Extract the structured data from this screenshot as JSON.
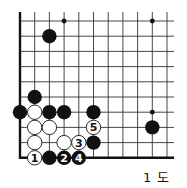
{
  "diagram": {
    "caption": "1 도",
    "grid": {
      "origin_x": 20,
      "origin_y": 21,
      "spacing_x": 14.7,
      "spacing_y": 15.2,
      "cols": 11,
      "rows": 10,
      "extend_right": 174,
      "extend_top": 12,
      "edges": [
        "left",
        "bottom"
      ]
    },
    "hoshi": [
      {
        "col": 3,
        "row": 0
      },
      {
        "col": 9,
        "row": 0
      },
      {
        "col": 9,
        "row": 6
      }
    ],
    "stones": [
      {
        "color": "black",
        "col": 2,
        "row": 1,
        "label": ""
      },
      {
        "color": "black",
        "col": 9,
        "row": 7,
        "label": ""
      },
      {
        "color": "black",
        "col": 1,
        "row": 5,
        "label": ""
      },
      {
        "color": "black",
        "col": 0,
        "row": 6,
        "label": ""
      },
      {
        "color": "white",
        "col": 1,
        "row": 6,
        "label": ""
      },
      {
        "color": "black",
        "col": 2,
        "row": 6,
        "label": ""
      },
      {
        "color": "black",
        "col": 3,
        "row": 6,
        "label": ""
      },
      {
        "color": "black",
        "col": 5,
        "row": 6,
        "label": ""
      },
      {
        "color": "white",
        "col": 1,
        "row": 7,
        "label": ""
      },
      {
        "color": "white",
        "col": 2,
        "row": 7,
        "label": ""
      },
      {
        "color": "white",
        "col": 5,
        "row": 7,
        "label": "5"
      },
      {
        "color": "white",
        "col": 1,
        "row": 8,
        "label": ""
      },
      {
        "color": "white",
        "col": 3,
        "row": 8,
        "label": ""
      },
      {
        "color": "white",
        "col": 4,
        "row": 8,
        "label": "3"
      },
      {
        "color": "black",
        "col": 5,
        "row": 8,
        "label": ""
      },
      {
        "color": "white",
        "col": 1,
        "row": 9,
        "label": "1"
      },
      {
        "color": "black",
        "col": 2,
        "row": 9,
        "label": ""
      },
      {
        "color": "black",
        "col": 3,
        "row": 9,
        "label": "2"
      },
      {
        "color": "black",
        "col": 4,
        "row": 9,
        "label": "4"
      }
    ],
    "colors": {
      "line": "#333333",
      "edge": "#111111",
      "black_stone": "#111111",
      "white_stone": "#ffffff"
    }
  }
}
